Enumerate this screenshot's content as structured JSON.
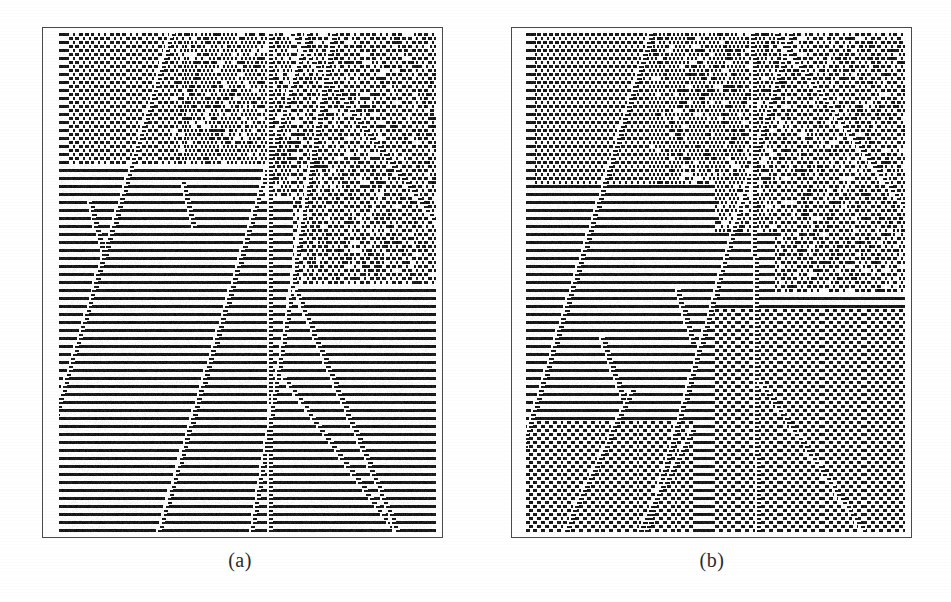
{
  "figure": {
    "background_color": "#ffffff",
    "ink_color": "#1a1a1a",
    "frame_color": "#4a4a4a",
    "width": 951,
    "height": 602,
    "kind": "cellular-automaton-spacetime-diagram-pair"
  },
  "panels": [
    {
      "id": "panel-a",
      "caption": "(a)",
      "frame": {
        "x": 42,
        "y": 27,
        "width": 401,
        "height": 511
      },
      "content_inset": {
        "left": 16,
        "top": 5,
        "right": 6,
        "bottom": 4
      },
      "caption_center_x": 240,
      "caption_y": 549
    },
    {
      "id": "panel-b",
      "caption": "(b)",
      "frame": {
        "x": 511,
        "y": 27,
        "width": 401,
        "height": 511
      },
      "content_inset": {
        "left": 14,
        "top": 5,
        "right": 6,
        "bottom": 4
      },
      "caption_center_x": 712,
      "caption_y": 549
    }
  ],
  "chart_data": {
    "type": "heatmap",
    "title": "",
    "subtitle": "",
    "xlabel": "",
    "ylabel": "",
    "grid": false,
    "legend_position": "none",
    "panels": [
      {
        "name": "(a)",
        "cells_x": 190,
        "cells_y": 125,
        "cell_px": 2,
        "background_phase": "horizontal-stripe",
        "stripe_period_rows": 2,
        "stripe_period_px": 5,
        "seed": 20117,
        "domains": [
          {
            "name": "upper-left-coarse",
            "x0": 0.02,
            "y0": 0.0,
            "x1": 0.3,
            "y1": 0.26,
            "texture": "stair-diagonal",
            "slope": -1.6,
            "density": 0.52
          },
          {
            "name": "upper-mid-dense",
            "x0": 0.3,
            "y0": 0.0,
            "x1": 0.62,
            "y1": 0.33,
            "texture": "dense-diagonal",
            "slope": 1.0,
            "density": 0.58
          },
          {
            "name": "upper-right-fine",
            "x0": 0.62,
            "y0": 0.0,
            "x1": 1.0,
            "y1": 0.5,
            "texture": "fine-diagonal",
            "slope": -1.0,
            "density": 0.5
          },
          {
            "name": "left-plain",
            "x0": 0.0,
            "y0": 0.26,
            "x1": 0.55,
            "y1": 1.0,
            "texture": "horizontal-stripe",
            "slope": 0,
            "density": 0.5
          },
          {
            "name": "lower-right-plain",
            "x0": 0.6,
            "y0": 0.55,
            "x1": 1.0,
            "y1": 1.0,
            "texture": "horizontal-stripe",
            "slope": 0,
            "density": 0.5
          }
        ],
        "defect_rays": [
          {
            "name": "ray-1",
            "x_start": 0.3,
            "y_start": 0.0,
            "slope_dx_per_dy": -0.62,
            "thickness": 2,
            "kind": "stair-left"
          },
          {
            "name": "ray-2",
            "x_start": 0.66,
            "y_start": 0.0,
            "slope_dx_per_dy": -0.6,
            "thickness": 2,
            "kind": "stair-left"
          },
          {
            "name": "ray-3",
            "x_start": 0.56,
            "y_start": 0.0,
            "slope_dx_per_dy": 0.0,
            "thickness": 2,
            "kind": "vertical"
          },
          {
            "name": "ray-4",
            "x_start": 0.62,
            "y_start": 0.0,
            "slope_dx_per_dy": 1.55,
            "thickness": 2,
            "kind": "stair-right"
          },
          {
            "name": "ray-5-v-left",
            "x_start": 0.73,
            "y_start": 0.0,
            "slope_dx_per_dy": -0.33,
            "thickness": 2,
            "kind": "stair-left"
          },
          {
            "name": "ray-6-v-right",
            "x_start": 0.6,
            "y_start": 0.69,
            "slope_dx_per_dy": 1.45,
            "thickness": 2,
            "kind": "stair-right"
          },
          {
            "name": "ray-7-lower",
            "x_start": 0.63,
            "y_start": 0.52,
            "slope_dx_per_dy": 0.85,
            "thickness": 2,
            "kind": "stair-right"
          },
          {
            "name": "ray-8-short",
            "x_start": 0.08,
            "y_start": 0.34,
            "slope_dx_per_dy": 0.55,
            "thickness": 2,
            "kind": "stair-right-short",
            "length": 0.1
          },
          {
            "name": "ray-9-short",
            "x_start": 0.33,
            "y_start": 0.3,
            "slope_dx_per_dy": 0.5,
            "thickness": 2,
            "kind": "stair-right-short",
            "length": 0.09
          }
        ]
      },
      {
        "name": "(b)",
        "cells_x": 190,
        "cells_y": 125,
        "cell_px": 2,
        "background_phase": "horizontal-stripe",
        "stripe_period_rows": 2,
        "stripe_period_px": 5,
        "seed": 77341,
        "domains": [
          {
            "name": "upper-left-coarse",
            "x0": 0.02,
            "y0": 0.0,
            "x1": 0.33,
            "y1": 0.3,
            "texture": "stair-diagonal",
            "slope": -1.5,
            "density": 0.52
          },
          {
            "name": "upper-mid-dense",
            "x0": 0.33,
            "y0": 0.0,
            "x1": 0.66,
            "y1": 0.4,
            "texture": "dense-diagonal",
            "slope": 1.0,
            "density": 0.6
          },
          {
            "name": "upper-right-fine",
            "x0": 0.66,
            "y0": 0.0,
            "x1": 1.0,
            "y1": 0.52,
            "texture": "fine-diagonal",
            "slope": -1.0,
            "density": 0.5
          },
          {
            "name": "left-plain",
            "x0": 0.0,
            "y0": 0.3,
            "x1": 0.5,
            "y1": 0.78,
            "texture": "horizontal-stripe",
            "slope": 0,
            "density": 0.5
          },
          {
            "name": "lower-left-diag",
            "x0": 0.0,
            "y0": 0.78,
            "x1": 0.45,
            "y1": 1.0,
            "texture": "stair-diagonal",
            "slope": 1.9,
            "density": 0.5
          },
          {
            "name": "lower-right-diag",
            "x0": 0.5,
            "y0": 0.55,
            "x1": 1.0,
            "y1": 1.0,
            "texture": "stair-diagonal",
            "slope": 2.1,
            "density": 0.5
          }
        ],
        "defect_rays": [
          {
            "name": "ray-1",
            "x_start": 0.33,
            "y_start": 0.0,
            "slope_dx_per_dy": -0.62,
            "thickness": 2,
            "kind": "stair-left"
          },
          {
            "name": "ray-2",
            "x_start": 0.7,
            "y_start": 0.0,
            "slope_dx_per_dy": -0.58,
            "thickness": 2,
            "kind": "stair-left"
          },
          {
            "name": "ray-3",
            "x_start": 0.6,
            "y_start": 0.0,
            "slope_dx_per_dy": 0.02,
            "thickness": 2,
            "kind": "vertical"
          },
          {
            "name": "ray-4",
            "x_start": 0.66,
            "y_start": 0.0,
            "slope_dx_per_dy": 1.5,
            "thickness": 2,
            "kind": "stair-right"
          },
          {
            "name": "ray-5-v-right",
            "x_start": 0.62,
            "y_start": 0.7,
            "slope_dx_per_dy": 1.4,
            "thickness": 2,
            "kind": "stair-right"
          },
          {
            "name": "ray-6-lower-left",
            "x_start": 0.28,
            "y_start": 0.72,
            "slope_dx_per_dy": -0.95,
            "thickness": 2,
            "kind": "stair-left"
          },
          {
            "name": "ray-7-lower-left2",
            "x_start": 0.44,
            "y_start": 0.8,
            "slope_dx_per_dy": -1.05,
            "thickness": 2,
            "kind": "stair-left"
          },
          {
            "name": "ray-8-mid",
            "x_start": 0.2,
            "y_start": 0.61,
            "slope_dx_per_dy": 0.7,
            "thickness": 2,
            "kind": "stair-right-short",
            "length": 0.12
          },
          {
            "name": "ray-9-mid",
            "x_start": 0.4,
            "y_start": 0.52,
            "slope_dx_per_dy": 0.6,
            "thickness": 2,
            "kind": "stair-right-short",
            "length": 0.1
          }
        ]
      }
    ]
  }
}
